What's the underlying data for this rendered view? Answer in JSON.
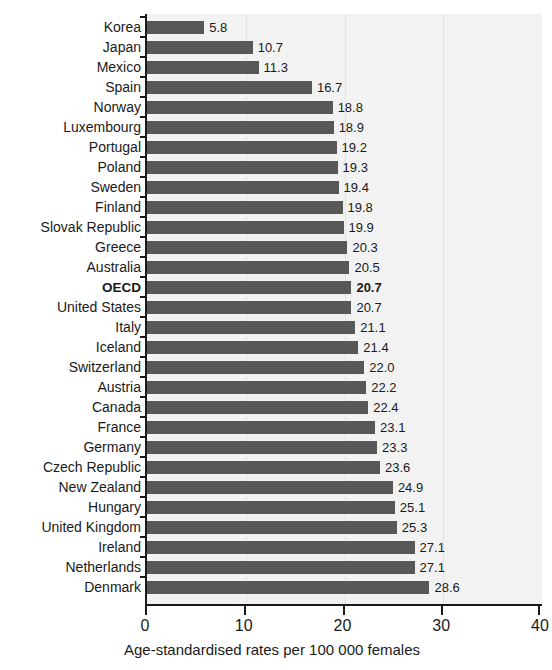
{
  "chart_data": {
    "type": "bar",
    "orientation": "horizontal",
    "title": "",
    "xlabel": "Age-standardised rates per 100 000 females",
    "ylabel": "",
    "xlim": [
      0,
      40
    ],
    "xticks": [
      0,
      10,
      20,
      30,
      40
    ],
    "xtick_labels": [
      "0",
      "10",
      "20",
      "30",
      "40"
    ],
    "grid": "vertical",
    "legend": "none",
    "bar_color": "#585858",
    "highlight_category": "OECD",
    "categories": [
      "Korea",
      "Japan",
      "Mexico",
      "Spain",
      "Norway",
      "Luxembourg",
      "Portugal",
      "Poland",
      "Sweden",
      "Finland",
      "Slovak Republic",
      "Greece",
      "Australia",
      "OECD",
      "United States",
      "Italy",
      "Iceland",
      "Switzerland",
      "Austria",
      "Canada",
      "France",
      "Germany",
      "Czech Republic",
      "New Zealand",
      "Hungary",
      "United Kingdom",
      "Ireland",
      "Netherlands",
      "Denmark"
    ],
    "values": [
      5.8,
      10.7,
      11.3,
      16.7,
      18.8,
      18.9,
      19.2,
      19.3,
      19.4,
      19.8,
      19.9,
      20.3,
      20.5,
      20.7,
      20.7,
      21.1,
      21.4,
      22.0,
      22.2,
      22.4,
      23.1,
      23.3,
      23.6,
      24.9,
      25.1,
      25.3,
      27.1,
      27.1,
      28.6
    ],
    "value_labels": [
      "5.8",
      "10.7",
      "11.3",
      "16.7",
      "18.8",
      "18.9",
      "19.2",
      "19.3",
      "19.4",
      "19.8",
      "19.9",
      "20.3",
      "20.5",
      "20.7",
      "20.7",
      "21.1",
      "21.4",
      "22.0",
      "22.2",
      "22.4",
      "23.1",
      "23.3",
      "23.6",
      "24.9",
      "25.1",
      "25.3",
      "27.1",
      "27.1",
      "28.6"
    ]
  }
}
